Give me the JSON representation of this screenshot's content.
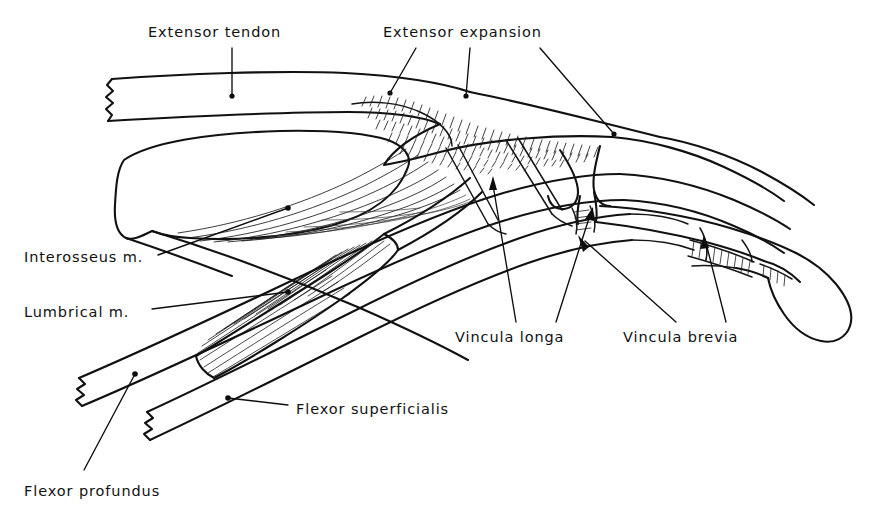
{
  "figure": {
    "kind": "anatomical-line-drawing",
    "width": 892,
    "height": 521,
    "background_color": "#ffffff",
    "ink_color": "#111111",
    "style": "black and white pen-and-ink line drawing, no shading except hatched muscle fibers"
  },
  "labels": [
    {
      "id": "extensor-tendon",
      "text": "Extensor tendon",
      "x": 148,
      "y": 25,
      "leader": "vertical line dropping from under the text down to a dot on the extensor tendon band"
    },
    {
      "id": "extensor-expansion",
      "text": "Extensor expansion",
      "x": 383,
      "y": 25,
      "leader": "three leader lines fanning from the text down to the hatched extensor expansion hood"
    },
    {
      "id": "interosseus-m",
      "text": "Interosseus m.",
      "x": 24,
      "y": 250,
      "leader": "line rising to the right, ending in a dot among the interosseus muscle fibers"
    },
    {
      "id": "lumbrical-m",
      "text": "Lumbrical m.",
      "x": 24,
      "y": 305,
      "leader": "line rising to the right, ending in a dot on the hatched lumbrical muscle belly"
    },
    {
      "id": "vincula-longa",
      "text": "Vincula longa",
      "x": 455,
      "y": 330,
      "leader": "two leader lines rising to arrowheads on the long vincular bands"
    },
    {
      "id": "vincula-brevia",
      "text": "Vincula brevia",
      "x": 623,
      "y": 330,
      "leader": "two leader lines rising to arrowheads on the short vincular attachments"
    },
    {
      "id": "flexor-superficialis",
      "text": "Flexor superficialis",
      "x": 296,
      "y": 402,
      "leader": "short line running up-left to a dot on the superficialis tendon"
    },
    {
      "id": "flexor-profundus",
      "text": "Flexor profundus",
      "x": 24,
      "y": 484,
      "leader": "long line running up-right to a dot on the profundus tendon"
    }
  ],
  "structures": [
    {
      "id": "extensor-tendon-band",
      "name": "Extensor tendon",
      "note": "proximal cut end shown with zigzag at far left"
    },
    {
      "id": "extensor-expansion-hood",
      "name": "Extensor expansion",
      "note": "densely hatched triangular hood over the proximal phalanx"
    },
    {
      "id": "interosseus-muscle",
      "name": "Interosseus m.",
      "note": "large muscle belly with long curved fibers converging to the expansion"
    },
    {
      "id": "lumbrical-muscle",
      "name": "Lumbrical m.",
      "note": "slender hatched muscle belly running to the radial side of the expansion"
    },
    {
      "id": "vinculum-longum",
      "name": "Vincula longa",
      "note": "two slender bands tethering the flexor tendons to the phalanx"
    },
    {
      "id": "vinculum-breve",
      "name": "Vincula brevia",
      "note": "short ladder-hatched attachments near the distal joint"
    },
    {
      "id": "flexor-superficialis-tendon",
      "name": "Flexor superficialis",
      "note": "tendon with zigzag cut end at lower left"
    },
    {
      "id": "flexor-profundus-tendon",
      "name": "Flexor profundus",
      "note": "deeper tendon with zigzag cut end at lower left"
    },
    {
      "id": "phalanges",
      "name": "Phalanges",
      "note": "proximal, middle and distal phalanges with fingertip pulp at far right"
    }
  ]
}
